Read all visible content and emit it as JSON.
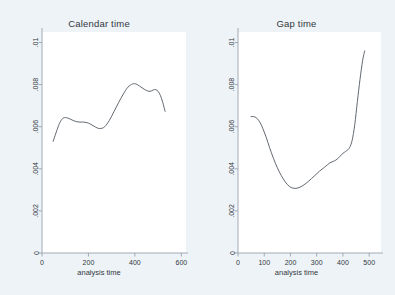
{
  "figure": {
    "background_color": "#eef3f8",
    "plot_background_color": "#ffffff",
    "line_color": "#5a6068",
    "axis_color": "#9aa3ad",
    "text_color": "#32383d"
  },
  "chart_data": [
    {
      "type": "line",
      "title": "Calendar time",
      "xlabel": "analysis time",
      "ylabel": "",
      "xlim": [
        0,
        620
      ],
      "ylim": [
        0,
        0.0105
      ],
      "xticks": [
        0,
        200,
        400,
        600
      ],
      "xtick_labels": [
        "0",
        "200",
        "400",
        "600"
      ],
      "yticks": [
        0,
        0.002,
        0.004,
        0.006,
        0.008,
        0.01
      ],
      "ytick_labels": [
        "0",
        ".002",
        ".004",
        ".006",
        ".008",
        ".01"
      ],
      "grid": false,
      "legend": "none",
      "x": [
        48,
        60,
        75,
        90,
        105,
        120,
        140,
        160,
        180,
        200,
        220,
        240,
        255,
        270,
        290,
        310,
        330,
        350,
        370,
        390,
        405,
        420,
        435,
        450,
        465,
        480,
        490,
        500,
        510,
        520,
        530
      ],
      "y": [
        0.0053,
        0.0057,
        0.00615,
        0.0064,
        0.00643,
        0.00637,
        0.00627,
        0.00622,
        0.00622,
        0.00617,
        0.00605,
        0.00593,
        0.00592,
        0.006,
        0.0063,
        0.00672,
        0.00715,
        0.00755,
        0.00788,
        0.00803,
        0.00803,
        0.00793,
        0.00782,
        0.00772,
        0.00768,
        0.00775,
        0.00776,
        0.00768,
        0.00748,
        0.00715,
        0.00673
      ]
    },
    {
      "type": "line",
      "title": "Gap time",
      "xlabel": "analysis time",
      "ylabel": "",
      "xlim": [
        0,
        545
      ],
      "ylim": [
        0,
        0.0105
      ],
      "xticks": [
        0,
        100,
        200,
        300,
        400,
        500
      ],
      "xtick_labels": [
        "0",
        "100",
        "200",
        "300",
        "400",
        "500"
      ],
      "yticks": [
        0,
        0.002,
        0.004,
        0.006,
        0.008,
        0.01
      ],
      "ytick_labels": [
        "0",
        ".002",
        ".004",
        ".006",
        ".008",
        ".01"
      ],
      "grid": false,
      "legend": "none",
      "x": [
        50,
        60,
        72,
        85,
        95,
        108,
        120,
        135,
        150,
        165,
        180,
        195,
        210,
        225,
        240,
        255,
        270,
        290,
        310,
        330,
        350,
        365,
        380,
        395,
        405,
        415,
        425,
        435,
        445,
        455,
        465,
        475,
        483
      ],
      "y": [
        0.00648,
        0.00648,
        0.0064,
        0.00618,
        0.0059,
        0.00548,
        0.00502,
        0.0045,
        0.00405,
        0.00368,
        0.00338,
        0.00317,
        0.00308,
        0.00308,
        0.00315,
        0.00327,
        0.00342,
        0.00365,
        0.00388,
        0.00408,
        0.00428,
        0.00436,
        0.00448,
        0.00468,
        0.00478,
        0.00487,
        0.005,
        0.00535,
        0.0061,
        0.0072,
        0.00825,
        0.00915,
        0.0096
      ]
    }
  ]
}
